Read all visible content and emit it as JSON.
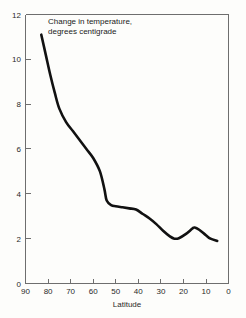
{
  "figure": {
    "background_color": "#fdfdfb",
    "frame_color": "#6e6e6e",
    "curve_color": "#111111"
  },
  "annotation": {
    "line1": "Change in temperature,",
    "line2": "degrees centigrade"
  },
  "axes": {
    "x_title": "Latitude",
    "y_title": "",
    "x_ticks": [
      "90",
      "80",
      "70",
      "60",
      "50",
      "40",
      "30",
      "20",
      "10",
      "0"
    ],
    "y_ticks": [
      "0",
      "2",
      "4",
      "6",
      "8",
      "10",
      "12"
    ]
  },
  "chart_data": {
    "type": "line",
    "title": "",
    "subtitle": "",
    "annotations": [
      "Change in temperature, degrees centigrade"
    ],
    "xlabel": "Latitude",
    "ylabel": "Change in temperature, degrees centigrade",
    "xlim": [
      90,
      0
    ],
    "ylim": [
      0,
      12
    ],
    "x_inverted": true,
    "grid": false,
    "legend": null,
    "xticks": [
      90,
      80,
      70,
      60,
      50,
      40,
      30,
      20,
      10,
      0
    ],
    "yticks": [
      0,
      2,
      4,
      6,
      8,
      10,
      12
    ],
    "series": [
      {
        "name": "Change in temperature",
        "x": [
          83,
          81,
          79,
          77,
          75,
          72,
          69,
          66,
          63,
          60,
          57,
          55,
          54,
          52,
          50,
          47,
          44,
          41,
          38,
          35,
          32,
          29,
          26,
          24,
          22,
          19,
          16,
          15,
          13,
          10,
          8,
          5
        ],
        "values": [
          11.1,
          10.2,
          9.3,
          8.5,
          7.8,
          7.2,
          6.8,
          6.4,
          6.0,
          5.6,
          5.0,
          4.2,
          3.7,
          3.5,
          3.45,
          3.4,
          3.35,
          3.3,
          3.1,
          2.9,
          2.65,
          2.35,
          2.1,
          2.0,
          2.02,
          2.2,
          2.45,
          2.5,
          2.4,
          2.15,
          2.0,
          1.9
        ]
      }
    ]
  }
}
